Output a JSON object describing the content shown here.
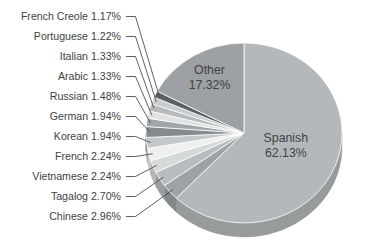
{
  "chart_data": {
    "type": "pie",
    "style": "3d-grayscale",
    "title": "",
    "unit": "%",
    "direction": "clockwise",
    "start_angle_deg": 0,
    "legend_position": "none",
    "text_color": "#3e4245",
    "leader_line_color": "#4b4e50",
    "slices": [
      {
        "label": "Spanish",
        "value": 62.13,
        "color": "#b5b8ba",
        "label_pos": "inside",
        "label_radius_frac": 0.46
      },
      {
        "label": "Chinese",
        "value": 2.96,
        "color": "#9ca2a5",
        "label_pos": "outside"
      },
      {
        "label": "Tagalog",
        "value": 2.7,
        "color": "#b7bcbe",
        "label_pos": "outside"
      },
      {
        "label": "Vietnamese",
        "value": 2.24,
        "color": "#d6d9da",
        "label_pos": "outside"
      },
      {
        "label": "French",
        "value": 2.24,
        "color": "#eef0f0",
        "label_pos": "outside"
      },
      {
        "label": "Korean",
        "value": 1.94,
        "color": "#c4c8ca",
        "label_pos": "outside"
      },
      {
        "label": "German",
        "value": 1.94,
        "color": "#858b8e",
        "label_pos": "outside"
      },
      {
        "label": "Russian",
        "value": 1.48,
        "color": "#9fa5a8",
        "label_pos": "outside"
      },
      {
        "label": "Arabic",
        "value": 1.33,
        "color": "#e0e2e3",
        "label_pos": "outside"
      },
      {
        "label": "Italian",
        "value": 1.33,
        "color": "#b6babc",
        "label_pos": "outside"
      },
      {
        "label": "Portuguese",
        "value": 1.22,
        "color": "#c9cdcf",
        "label_pos": "outside"
      },
      {
        "label": "French Creole",
        "value": 1.17,
        "color": "#5a6165",
        "label_pos": "outside"
      },
      {
        "label": "Other",
        "value": 17.32,
        "color": "#9da1a3",
        "label_pos": "inside",
        "label_radius_frac": 0.68
      }
    ]
  }
}
